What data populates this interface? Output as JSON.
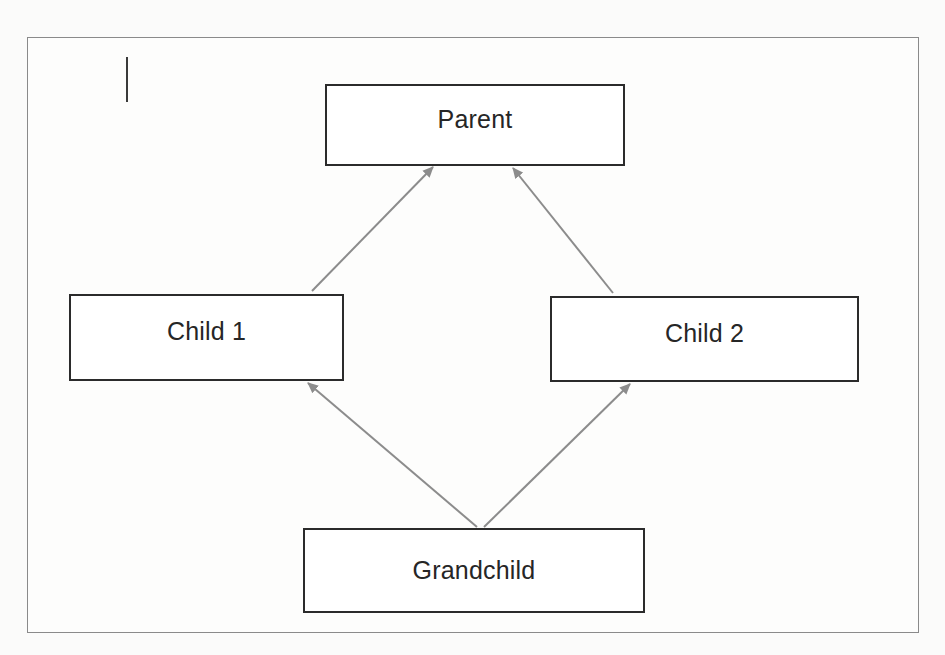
{
  "diagram": {
    "type": "hierarchy",
    "nodes": {
      "parent": "Parent",
      "child1": "Child 1",
      "child2": "Child 2",
      "grandchild": "Grandchild"
    },
    "edges": [
      {
        "from": "Child 1",
        "to": "Parent"
      },
      {
        "from": "Child 2",
        "to": "Parent"
      },
      {
        "from": "Grandchild",
        "to": "Child 1"
      },
      {
        "from": "Grandchild",
        "to": "Child 2"
      }
    ],
    "colors": {
      "node_border": "#2b2b2b",
      "arrow": "#8c8c8c",
      "frame_border": "#8a8a8a",
      "background": "#fbfbfa"
    }
  }
}
